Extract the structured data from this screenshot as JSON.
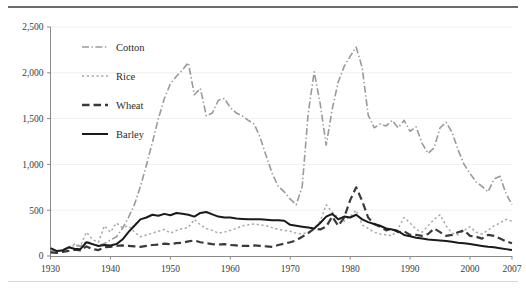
{
  "figure": {
    "name": "crop-production-line-chart",
    "background_color": "#ffffff",
    "top_rule_color": "#6b6b6b",
    "bottom_rule_color": "#d8d8d8"
  },
  "chart_data": {
    "type": "line",
    "title": "",
    "subtitle": "",
    "xlabel": "",
    "ylabel": "",
    "xlim": [
      1930,
      2007
    ],
    "ylim": [
      0,
      2500
    ],
    "grid": true,
    "grid_axis": "y",
    "legend_position": "upper-left-inside",
    "x_tick_labels": [
      "1930",
      "1940",
      "1950",
      "1960",
      "1970",
      "1980",
      "1990",
      "2000",
      "2007"
    ],
    "x_ticks": [
      1930,
      1940,
      1950,
      1960,
      1970,
      1980,
      1990,
      2000,
      2007
    ],
    "y_tick_labels": [
      "0",
      "500",
      "1,000",
      "1,500",
      "2,000",
      "2,500"
    ],
    "y_ticks": [
      0,
      500,
      1000,
      1500,
      2000,
      2500
    ],
    "x": [
      1930,
      1931,
      1932,
      1933,
      1934,
      1935,
      1936,
      1937,
      1938,
      1939,
      1940,
      1941,
      1942,
      1943,
      1944,
      1945,
      1946,
      1947,
      1948,
      1949,
      1950,
      1951,
      1952,
      1953,
      1954,
      1955,
      1956,
      1957,
      1958,
      1959,
      1960,
      1961,
      1962,
      1963,
      1964,
      1965,
      1966,
      1967,
      1968,
      1969,
      1970,
      1971,
      1972,
      1973,
      1974,
      1975,
      1976,
      1977,
      1978,
      1979,
      1980,
      1981,
      1982,
      1983,
      1984,
      1985,
      1986,
      1987,
      1988,
      1989,
      1990,
      1991,
      1992,
      1993,
      1994,
      1995,
      1996,
      1997,
      1998,
      1999,
      2000,
      2001,
      2002,
      2003,
      2004,
      2005,
      2006,
      2007
    ],
    "series": [
      {
        "name": "Cotton",
        "line_style": "dash-dot",
        "color": "#9a9a9a",
        "width": 1.6,
        "values": [
          60,
          55,
          70,
          85,
          120,
          105,
          160,
          130,
          115,
          135,
          175,
          210,
          300,
          420,
          560,
          760,
          990,
          1240,
          1500,
          1720,
          1880,
          1960,
          2030,
          2110,
          1760,
          1830,
          1530,
          1560,
          1700,
          1720,
          1620,
          1560,
          1530,
          1480,
          1440,
          1290,
          1090,
          900,
          760,
          700,
          620,
          560,
          760,
          1560,
          2010,
          1660,
          1210,
          1600,
          1900,
          2070,
          2180,
          2280,
          2060,
          1540,
          1400,
          1440,
          1420,
          1480,
          1400,
          1480,
          1360,
          1410,
          1230,
          1120,
          1180,
          1400,
          1460,
          1350,
          1160,
          1000,
          900,
          810,
          760,
          700,
          840,
          870,
          680,
          560
        ]
      },
      {
        "name": "Rice",
        "line_style": "dotted",
        "color": "#a8a8a8",
        "width": 1.5,
        "values": [
          55,
          50,
          70,
          95,
          130,
          110,
          260,
          180,
          150,
          330,
          260,
          360,
          310,
          330,
          260,
          210,
          230,
          250,
          270,
          290,
          250,
          280,
          300,
          310,
          400,
          340,
          300,
          280,
          250,
          260,
          280,
          300,
          330,
          340,
          350,
          340,
          330,
          310,
          290,
          280,
          270,
          250,
          240,
          260,
          300,
          380,
          560,
          480,
          420,
          380,
          430,
          500,
          340,
          300,
          260,
          240,
          230,
          220,
          300,
          420,
          360,
          290,
          260,
          330,
          400,
          450,
          330,
          250,
          230,
          280,
          320,
          260,
          240,
          280,
          330,
          360,
          400,
          380
        ]
      },
      {
        "name": "Wheat",
        "line_style": "dashed-long",
        "color": "#3a3a3a",
        "width": 2.2,
        "values": [
          40,
          35,
          45,
          55,
          70,
          60,
          105,
          75,
          65,
          95,
          100,
          110,
          115,
          110,
          105,
          100,
          110,
          120,
          125,
          135,
          130,
          140,
          145,
          160,
          170,
          150,
          140,
          130,
          125,
          130,
          120,
          115,
          110,
          110,
          115,
          110,
          105,
          100,
          120,
          135,
          150,
          170,
          210,
          250,
          300,
          290,
          320,
          430,
          330,
          420,
          610,
          750,
          600,
          420,
          350,
          320,
          280,
          300,
          260,
          270,
          230,
          230,
          220,
          240,
          300,
          260,
          220,
          230,
          260,
          280,
          220,
          210,
          190,
          230,
          220,
          190,
          160,
          140
        ]
      },
      {
        "name": "Barley",
        "line_style": "solid",
        "color": "#1a1a1a",
        "width": 2.0,
        "values": [
          85,
          55,
          60,
          95,
          80,
          75,
          150,
          130,
          110,
          120,
          115,
          130,
          180,
          260,
          330,
          400,
          420,
          450,
          440,
          460,
          445,
          470,
          460,
          450,
          430,
          470,
          480,
          455,
          430,
          420,
          420,
          410,
          405,
          400,
          400,
          400,
          395,
          390,
          390,
          385,
          340,
          330,
          320,
          310,
          300,
          360,
          430,
          460,
          400,
          430,
          420,
          450,
          400,
          370,
          350,
          330,
          300,
          290,
          270,
          230,
          215,
          200,
          190,
          180,
          175,
          170,
          165,
          155,
          145,
          140,
          130,
          120,
          110,
          100,
          95,
          85,
          75,
          65
        ]
      }
    ],
    "legend": [
      {
        "label": "Cotton",
        "style": "dash-dot",
        "color": "#9a9a9a"
      },
      {
        "label": "Rice",
        "style": "dotted",
        "color": "#a8a8a8"
      },
      {
        "label": "Wheat",
        "style": "dashed-long",
        "color": "#3a3a3a"
      },
      {
        "label": "Barley",
        "style": "solid",
        "color": "#1a1a1a"
      }
    ]
  }
}
